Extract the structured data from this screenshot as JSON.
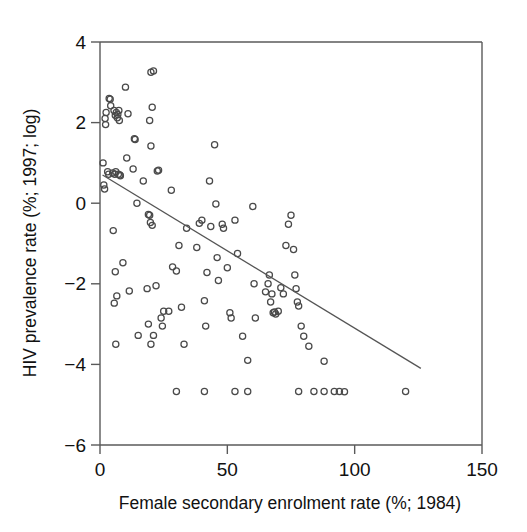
{
  "chart_data": {
    "type": "scatter",
    "title": "",
    "xlabel": "Female secondary enrolment rate (%; 1984)",
    "ylabel": "HIV prevalence rate (%; 1997; log)",
    "xlim": [
      0,
      150
    ],
    "ylim": [
      -6,
      4
    ],
    "xticks": [
      0,
      50,
      100,
      150
    ],
    "yticks": [
      4,
      2,
      0,
      -2,
      -4,
      -6
    ],
    "xtick_labels": [
      "0",
      "50",
      "100",
      "150"
    ],
    "ytick_labels": [
      "4",
      "2",
      "0",
      "-2",
      "-4",
      "-6"
    ],
    "grid": false,
    "legend": null,
    "legend_position": "none",
    "marker_style": "open-circle",
    "marker_color": "#4a4a4a",
    "series": [
      {
        "name": "Countries",
        "points": [
          [
            1.2,
            1.0
          ],
          [
            1.5,
            0.45
          ],
          [
            1.8,
            0.35
          ],
          [
            2.0,
            2.1
          ],
          [
            2.2,
            1.95
          ],
          [
            2.4,
            2.25
          ],
          [
            3.0,
            0.78
          ],
          [
            3.4,
            0.72
          ],
          [
            3.6,
            2.6
          ],
          [
            4.0,
            2.58
          ],
          [
            4.2,
            2.42
          ],
          [
            5.5,
            2.3
          ],
          [
            6.0,
            2.18
          ],
          [
            6.4,
            2.25
          ],
          [
            6.8,
            2.12
          ],
          [
            7.0,
            2.2
          ],
          [
            7.4,
            2.3
          ],
          [
            7.6,
            2.05
          ],
          [
            5.0,
            0.75
          ],
          [
            5.8,
            0.72
          ],
          [
            6.2,
            0.78
          ],
          [
            7.2,
            0.72
          ],
          [
            7.8,
            0.7
          ],
          [
            8.0,
            0.68
          ],
          [
            5.2,
            -0.68
          ],
          [
            5.6,
            -2.48
          ],
          [
            6.0,
            -1.7
          ],
          [
            6.6,
            -2.3
          ],
          [
            6.2,
            -3.5
          ],
          [
            9.0,
            -1.48
          ],
          [
            10.0,
            2.88
          ],
          [
            10.5,
            1.12
          ],
          [
            11.0,
            2.22
          ],
          [
            11.5,
            -2.18
          ],
          [
            13.0,
            0.85
          ],
          [
            13.5,
            1.6
          ],
          [
            13.8,
            1.58
          ],
          [
            14.5,
            0.0
          ],
          [
            15.0,
            -3.28
          ],
          [
            17.0,
            0.55
          ],
          [
            20.0,
            3.25
          ],
          [
            21.0,
            3.28
          ],
          [
            20.5,
            2.38
          ],
          [
            19.5,
            2.05
          ],
          [
            20.0,
            1.42
          ],
          [
            19.0,
            -0.28
          ],
          [
            19.5,
            -0.3
          ],
          [
            19.8,
            -0.48
          ],
          [
            20.5,
            -0.55
          ],
          [
            18.5,
            -2.12
          ],
          [
            19.0,
            -3.0
          ],
          [
            20.0,
            -3.5
          ],
          [
            21.0,
            -3.28
          ],
          [
            22.0,
            -2.05
          ],
          [
            22.5,
            0.8
          ],
          [
            23.0,
            0.82
          ],
          [
            24.0,
            -2.85
          ],
          [
            24.5,
            -3.05
          ],
          [
            25.0,
            -2.68
          ],
          [
            27.0,
            -2.68
          ],
          [
            28.0,
            0.32
          ],
          [
            28.5,
            -1.58
          ],
          [
            30.0,
            -1.68
          ],
          [
            31.0,
            -1.05
          ],
          [
            32.0,
            -2.58
          ],
          [
            33.0,
            -3.5
          ],
          [
            34.0,
            -0.62
          ],
          [
            38.0,
            -1.1
          ],
          [
            39.0,
            -0.5
          ],
          [
            40.0,
            -0.42
          ],
          [
            41.0,
            -2.42
          ],
          [
            41.5,
            -3.05
          ],
          [
            42.0,
            -1.72
          ],
          [
            43.0,
            0.55
          ],
          [
            43.5,
            -0.58
          ],
          [
            45.0,
            1.45
          ],
          [
            45.5,
            -0.02
          ],
          [
            46.0,
            -1.35
          ],
          [
            46.5,
            -1.92
          ],
          [
            48.0,
            -0.52
          ],
          [
            48.5,
            -0.62
          ],
          [
            50.0,
            -1.6
          ],
          [
            51.0,
            -2.72
          ],
          [
            51.5,
            -2.85
          ],
          [
            53.0,
            -0.42
          ],
          [
            54.0,
            -1.25
          ],
          [
            56.0,
            -3.3
          ],
          [
            58.0,
            -3.9
          ],
          [
            60.0,
            -0.08
          ],
          [
            60.5,
            -2.0
          ],
          [
            61.0,
            -2.85
          ],
          [
            65.0,
            -2.2
          ],
          [
            66.0,
            -2.0
          ],
          [
            66.5,
            -1.78
          ],
          [
            67.0,
            -2.45
          ],
          [
            67.5,
            -2.25
          ],
          [
            68.0,
            -2.72
          ],
          [
            68.5,
            -2.7
          ],
          [
            69.0,
            -2.75
          ],
          [
            70.0,
            -2.68
          ],
          [
            71.0,
            -2.1
          ],
          [
            72.0,
            -2.25
          ],
          [
            73.0,
            -1.05
          ],
          [
            74.0,
            -0.52
          ],
          [
            75.0,
            -0.3
          ],
          [
            76.0,
            -1.15
          ],
          [
            76.5,
            -1.78
          ],
          [
            77.0,
            -2.12
          ],
          [
            77.5,
            -2.45
          ],
          [
            78.0,
            -2.55
          ],
          [
            79.0,
            -3.05
          ],
          [
            80.0,
            -3.3
          ],
          [
            82.0,
            -3.55
          ],
          [
            88.0,
            -3.92
          ],
          [
            96.0,
            -4.68
          ],
          [
            30.0,
            -4.67
          ],
          [
            41.0,
            -4.67
          ],
          [
            53.0,
            -4.67
          ],
          [
            58.0,
            -4.67
          ],
          [
            78.0,
            -4.67
          ],
          [
            84.0,
            -4.67
          ],
          [
            88.0,
            -4.67
          ],
          [
            92.0,
            -4.67
          ],
          [
            94.0,
            -4.67
          ],
          [
            120.0,
            -4.67
          ]
        ]
      }
    ],
    "fit_line": {
      "name": "linear regression",
      "x_start": 1.0,
      "y_start": 0.7,
      "x_end": 126.0,
      "y_end": -4.1,
      "color": "#555555"
    }
  }
}
